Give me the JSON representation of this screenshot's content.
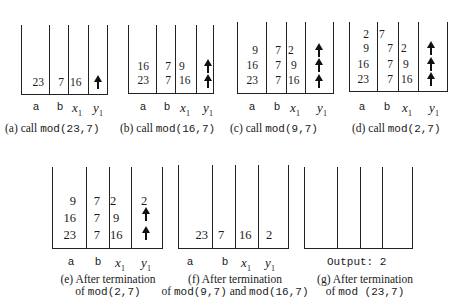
{
  "column_labels": {
    "a": "a",
    "b": "b",
    "x": "x",
    "x_sub": "1",
    "y": "y",
    "y_sub": "1"
  },
  "panels": [
    {
      "id": "a",
      "caption_prefix": "(a) call ",
      "caption_code": "mod(23,7)",
      "rows": [
        {
          "a": "23",
          "b": "7",
          "x1": "16",
          "y1": "arrow"
        }
      ]
    },
    {
      "id": "b",
      "caption_prefix": "(b) call ",
      "caption_code": "mod(16,7)",
      "rows": [
        {
          "a": "16",
          "b": "7",
          "x1": "9",
          "y1": "arrow"
        },
        {
          "a": "23",
          "b": "7",
          "x1": "16",
          "y1": "arrow"
        }
      ]
    },
    {
      "id": "c",
      "caption_prefix": "(c) call ",
      "caption_code": "mod(9,7)",
      "rows": [
        {
          "a": "9",
          "b": "7",
          "x1": "2",
          "y1": "arrow"
        },
        {
          "a": "16",
          "b": "7",
          "x1": "9",
          "y1": "arrow"
        },
        {
          "a": "23",
          "b": "7",
          "x1": "16",
          "y1": "arrow"
        }
      ]
    },
    {
      "id": "d",
      "caption_prefix": "(d) call ",
      "caption_code": "mod(2,7)",
      "rows": [
        {
          "a": "2",
          "b": "7",
          "x1": "",
          "y1": ""
        },
        {
          "a": "9",
          "b": "7",
          "x1": "2",
          "y1": "arrow"
        },
        {
          "a": "16",
          "b": "7",
          "x1": "9",
          "y1": "arrow"
        },
        {
          "a": "23",
          "b": "7",
          "x1": "16",
          "y1": "arrow"
        }
      ]
    },
    {
      "id": "e",
      "caption_line1": "(e) After termination",
      "caption_line2_prefix": "of ",
      "caption_line2_code": "mod(2,7)",
      "rows": [
        {
          "a": "9",
          "b": "7",
          "x1": "2",
          "y1": "2"
        },
        {
          "a": "16",
          "b": "7",
          "x1": "9",
          "y1": "arrow"
        },
        {
          "a": "23",
          "b": "7",
          "x1": "16",
          "y1": "arrow"
        }
      ]
    },
    {
      "id": "f",
      "caption_line1": "(f) After termination",
      "caption_line2_prefix": "of ",
      "caption_line2_code1": "mod(9,7)",
      "caption_line2_mid": " and ",
      "caption_line2_code2": "mod(16,7)",
      "rows": [
        {
          "a": "23",
          "b": "7",
          "x1": "16",
          "y1": "2"
        }
      ]
    },
    {
      "id": "g",
      "output_text": "Output: 2",
      "caption_line1": "(g) After termination",
      "caption_line2_prefix": "of ",
      "caption_line2_code": "mod (23,7)",
      "rows": []
    }
  ]
}
